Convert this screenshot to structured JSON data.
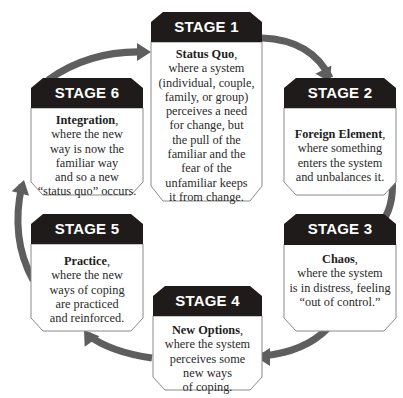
{
  "diagram": {
    "type": "cycle",
    "direction": "clockwise",
    "colors": {
      "header_fill": "#1f1b1a",
      "header_text": "#ffffff",
      "box_fill": "#ffffff",
      "box_border": "#8a8a8a",
      "arrow_fill": "#5e5e5e",
      "text": "#2a2a2a"
    },
    "stages": [
      {
        "id": "stage-1",
        "header": "STAGE 1",
        "title": "Status Quo",
        "punct": ",",
        "lines": [
          "where a system",
          "(individual, couple,",
          "family, or group)",
          "perceives a need",
          "for change, but",
          "the pull of the",
          "familiar and the",
          "fear of the",
          "unfamiliar keeps",
          "it from change."
        ]
      },
      {
        "id": "stage-2",
        "header": "STAGE 2",
        "title": "Foreign Element",
        "punct": ",",
        "lines": [
          "where something",
          "enters the system",
          "and unbalances it."
        ]
      },
      {
        "id": "stage-3",
        "header": "STAGE 3",
        "title": "Chaos",
        "punct": ",",
        "lines": [
          "where the system",
          "is in distress, feeling",
          "“out of control.”"
        ]
      },
      {
        "id": "stage-4",
        "header": "STAGE 4",
        "title": "New Options",
        "punct": ",",
        "lines": [
          "where the system",
          "perceives some",
          "new ways",
          "of coping."
        ]
      },
      {
        "id": "stage-5",
        "header": "STAGE 5",
        "title": "Practice",
        "punct": ",",
        "lines": [
          "where the new",
          "ways of coping",
          "are practiced",
          "and reinforced."
        ]
      },
      {
        "id": "stage-6",
        "header": "STAGE 6",
        "title": "Integration",
        "punct": ",",
        "lines": [
          "where the new",
          "way is now the",
          "familiar way",
          "and so a new",
          "“status quo” occurs."
        ]
      }
    ],
    "arrows": [
      {
        "from": "stage-1",
        "to": "stage-2"
      },
      {
        "from": "stage-2",
        "to": "stage-3"
      },
      {
        "from": "stage-3",
        "to": "stage-4"
      },
      {
        "from": "stage-4",
        "to": "stage-5"
      },
      {
        "from": "stage-5",
        "to": "stage-6"
      },
      {
        "from": "stage-6",
        "to": "stage-1"
      }
    ]
  }
}
